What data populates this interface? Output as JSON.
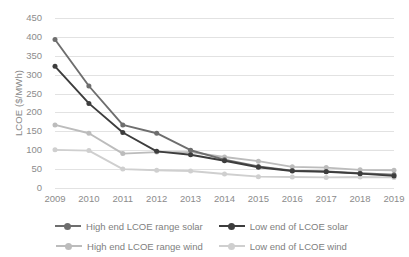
{
  "chart_data": {
    "type": "line",
    "title": "",
    "xlabel": "",
    "ylabel": "LCOE ($/MWh)",
    "categories": [
      "2009",
      "2010",
      "2011",
      "2012",
      "2013",
      "2014",
      "2015",
      "2016",
      "2017",
      "2018",
      "2019"
    ],
    "x": [
      2009,
      2010,
      2011,
      2012,
      2013,
      2014,
      2015,
      2016,
      2017,
      2018,
      2019
    ],
    "ylim": [
      0,
      450
    ],
    "ytick_values": [
      0,
      50,
      100,
      150,
      200,
      250,
      300,
      350,
      400,
      450
    ],
    "ytick_labels": [
      "0",
      "50",
      "100",
      "150",
      "200",
      "250",
      "300",
      "350",
      "400",
      "450"
    ],
    "grid": true,
    "legend_position": "bottom",
    "series": [
      {
        "name": "High end LCOE range solar",
        "color": "#6e6e6e",
        "marker": "circle",
        "values": [
          393,
          270,
          167,
          145,
          100,
          75,
          57,
          46,
          44,
          39,
          35
        ]
      },
      {
        "name": "Low end of LCOE solar",
        "color": "#3d3d3d",
        "marker": "circle",
        "values": [
          322,
          224,
          147,
          97,
          88,
          72,
          55,
          45,
          43,
          38,
          32
        ]
      },
      {
        "name": "High end LCOE range wind",
        "color": "#bcbcbc",
        "marker": "circle",
        "values": [
          167,
          145,
          91,
          95,
          95,
          82,
          71,
          56,
          54,
          48,
          47
        ]
      },
      {
        "name": "Low end of LCOE wind",
        "color": "#cfcfcf",
        "marker": "circle",
        "values": [
          101,
          99,
          50,
          47,
          45,
          37,
          30,
          29,
          28,
          29,
          28
        ]
      }
    ]
  },
  "legend": {
    "items": [
      {
        "label": "High end LCOE range solar"
      },
      {
        "label": "Low end of LCOE solar"
      },
      {
        "label": "High end LCOE range wind"
      },
      {
        "label": "Low end of LCOE wind"
      }
    ]
  }
}
